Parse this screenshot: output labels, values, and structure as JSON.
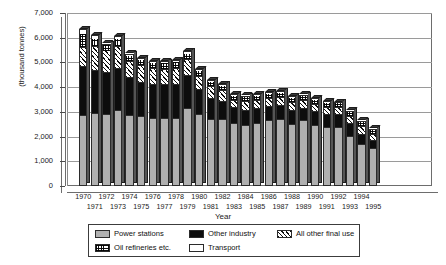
{
  "chart_data": {
    "type": "bar",
    "stacked": true,
    "title": "",
    "xlabel": "Year",
    "ylabel": "(thousand tonnes)",
    "ylim": [
      0,
      7000
    ],
    "yticks": [
      0,
      1000,
      2000,
      3000,
      4000,
      5000,
      6000,
      7000
    ],
    "ytick_labels": [
      "0",
      "1,000",
      "2,000",
      "3,000",
      "4,000",
      "5,000",
      "6,000",
      "7,000"
    ],
    "grid": true,
    "legend_position": "bottom",
    "categories": [
      "1970",
      "1971",
      "1972",
      "1973",
      "1974",
      "1975",
      "1976",
      "1977",
      "1978",
      "1979",
      "1980",
      "1981",
      "1982",
      "1983",
      "1984",
      "1985",
      "1986",
      "1987",
      "1988",
      "1989",
      "1990",
      "1991",
      "1992",
      "1993",
      "1994",
      "1995"
    ],
    "series": [
      {
        "name": "Power stations",
        "color": "#b0b0b0",
        "pattern": "solid-grey",
        "values": [
          2870,
          2940,
          2930,
          3080,
          2890,
          2830,
          2760,
          2740,
          2760,
          3150,
          2930,
          2720,
          2700,
          2530,
          2460,
          2530,
          2660,
          2710,
          2490,
          2660,
          2450,
          2390,
          2400,
          2010,
          1700,
          1530
        ]
      },
      {
        "name": "Other industry",
        "color": "#0d0d0d",
        "pattern": "solid-black",
        "values": [
          1980,
          1770,
          1690,
          1700,
          1500,
          1380,
          1370,
          1370,
          1350,
          1360,
          1010,
          840,
          740,
          650,
          630,
          620,
          590,
          550,
          600,
          510,
          580,
          530,
          530,
          540,
          420,
          330
        ]
      },
      {
        "name": "All other final use",
        "color": "#ffffff",
        "pattern": "diagonal-hatch",
        "values": [
          780,
          940,
          890,
          900,
          660,
          690,
          660,
          640,
          650,
          640,
          530,
          470,
          450,
          320,
          340,
          330,
          310,
          330,
          300,
          290,
          290,
          280,
          270,
          290,
          300,
          250
        ]
      },
      {
        "name": "Oil refineries etc.",
        "color": "#ffffff",
        "pattern": "grid-hatch",
        "values": [
          550,
          340,
          250,
          290,
          240,
          240,
          230,
          260,
          300,
          250,
          220,
          220,
          210,
          200,
          200,
          210,
          220,
          230,
          220,
          210,
          200,
          190,
          180,
          180,
          200,
          180
        ]
      },
      {
        "name": "Transport",
        "color": "#ffffff",
        "pattern": "solid-white",
        "values": [
          180,
          120,
          0,
          110,
          70,
          50,
          40,
          40,
          30,
          70,
          50,
          50,
          40,
          30,
          30,
          30,
          30,
          30,
          30,
          30,
          30,
          30,
          30,
          30,
          30,
          30
        ]
      }
    ],
    "totals": [
      6360,
      6110,
      5760,
      6080,
      5360,
      5190,
      5060,
      5050,
      5090,
      5470,
      4740,
      4300,
      4140,
      3730,
      3660,
      3720,
      3810,
      3850,
      3640,
      3700,
      3550,
      3420,
      3410,
      3050,
      2620,
      2320
    ]
  },
  "legend": {
    "items": [
      {
        "label": "Power stations"
      },
      {
        "label": "Other industry"
      },
      {
        "label": "All other final use"
      },
      {
        "label": "Oil refineries etc."
      },
      {
        "label": "Transport"
      }
    ]
  }
}
